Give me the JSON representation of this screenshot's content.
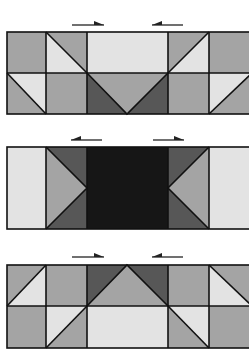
{
  "colors": {
    "medium": "#a4a4a4",
    "light": "#e3e3e3",
    "dark": "#575757",
    "black": "#161616",
    "stroke": "#111111",
    "background": "#ffffff"
  },
  "columns": [
    7,
    46,
    87,
    168,
    209,
    252
  ],
  "panels": [
    {
      "name": "top-panel",
      "top": 32,
      "mid": 73,
      "bottom": 114,
      "arrows": [
        {
          "x1": 72,
          "x2": 104,
          "y": 25,
          "direction": "right"
        },
        {
          "x1": 152,
          "x2": 183,
          "y": 25,
          "direction": "left"
        }
      ],
      "shapes": [
        {
          "type": "rect",
          "x": 7,
          "y": 32,
          "w": 39,
          "h": 41,
          "fill": "medium"
        },
        {
          "type": "poly",
          "points": "46,32 87,32 87,73",
          "fill": "medium"
        },
        {
          "type": "poly",
          "points": "46,32 87,73 46,73",
          "fill": "light"
        },
        {
          "type": "rect",
          "x": 87,
          "y": 32,
          "w": 81,
          "h": 41,
          "fill": "light"
        },
        {
          "type": "poly",
          "points": "168,32 209,32 168,73",
          "fill": "medium"
        },
        {
          "type": "poly",
          "points": "209,32 209,73 168,73",
          "fill": "light"
        },
        {
          "type": "rect",
          "x": 209,
          "y": 32,
          "w": 43,
          "h": 41,
          "fill": "medium"
        },
        {
          "type": "poly",
          "points": "7,73 46,73 46,114",
          "fill": "light"
        },
        {
          "type": "poly",
          "points": "7,73 46,114 7,114",
          "fill": "medium"
        },
        {
          "type": "rect",
          "x": 46,
          "y": 73,
          "w": 41,
          "h": 41,
          "fill": "medium"
        },
        {
          "type": "poly",
          "points": "87,73 87,114 127,114",
          "fill": "dark"
        },
        {
          "type": "poly",
          "points": "168,73 168,114 127,114",
          "fill": "dark"
        },
        {
          "type": "poly",
          "points": "87,73 168,73 127,114",
          "fill": "medium"
        },
        {
          "type": "rect",
          "x": 168,
          "y": 73,
          "w": 41,
          "h": 41,
          "fill": "medium"
        },
        {
          "type": "poly",
          "points": "209,73 252,73 209,114",
          "fill": "light"
        },
        {
          "type": "poly",
          "points": "252,73 252,114 209,114",
          "fill": "medium"
        }
      ]
    },
    {
      "name": "middle-panel",
      "top": 147,
      "mid": null,
      "bottom": 229,
      "arrows": [
        {
          "x1": 71,
          "x2": 102,
          "y": 140,
          "direction": "left"
        },
        {
          "x1": 153,
          "x2": 184,
          "y": 140,
          "direction": "right"
        }
      ],
      "shapes": [
        {
          "type": "rect",
          "x": 7,
          "y": 147,
          "w": 39,
          "h": 82,
          "fill": "light"
        },
        {
          "type": "poly",
          "points": "46,147 87,147 87,188",
          "fill": "dark"
        },
        {
          "type": "poly",
          "points": "46,229 87,229 87,188",
          "fill": "dark"
        },
        {
          "type": "poly",
          "points": "46,147 87,188 46,229",
          "fill": "medium"
        },
        {
          "type": "rect",
          "x": 87,
          "y": 147,
          "w": 81,
          "h": 82,
          "fill": "black"
        },
        {
          "type": "poly",
          "points": "168,147 209,147 168,188",
          "fill": "dark"
        },
        {
          "type": "poly",
          "points": "168,229 209,229 168,188",
          "fill": "dark"
        },
        {
          "type": "poly",
          "points": "209,147 209,229 168,188",
          "fill": "medium"
        },
        {
          "type": "rect",
          "x": 209,
          "y": 147,
          "w": 43,
          "h": 82,
          "fill": "light"
        }
      ]
    },
    {
      "name": "bottom-panel",
      "top": 265,
      "mid": 306,
      "bottom": 348,
      "arrows": [
        {
          "x1": 72,
          "x2": 104,
          "y": 257,
          "direction": "right"
        },
        {
          "x1": 152,
          "x2": 183,
          "y": 257,
          "direction": "left"
        }
      ],
      "shapes": [
        {
          "type": "poly",
          "points": "7,265 46,265 7,306",
          "fill": "medium"
        },
        {
          "type": "poly",
          "points": "46,265 46,306 7,306",
          "fill": "light"
        },
        {
          "type": "rect",
          "x": 46,
          "y": 265,
          "w": 41,
          "h": 41,
          "fill": "medium"
        },
        {
          "type": "poly",
          "points": "87,265 127,265 87,306",
          "fill": "dark"
        },
        {
          "type": "poly",
          "points": "127,265 168,265 168,306",
          "fill": "dark"
        },
        {
          "type": "poly",
          "points": "127,265 168,306 87,306",
          "fill": "medium"
        },
        {
          "type": "rect",
          "x": 168,
          "y": 265,
          "w": 41,
          "h": 41,
          "fill": "medium"
        },
        {
          "type": "poly",
          "points": "209,265 252,265 252,306",
          "fill": "medium"
        },
        {
          "type": "poly",
          "points": "209,265 252,306 209,306",
          "fill": "light"
        },
        {
          "type": "rect",
          "x": 7,
          "y": 306,
          "w": 39,
          "h": 42,
          "fill": "medium"
        },
        {
          "type": "poly",
          "points": "46,306 87,306 46,348",
          "fill": "light"
        },
        {
          "type": "poly",
          "points": "87,306 87,348 46,348",
          "fill": "medium"
        },
        {
          "type": "rect",
          "x": 87,
          "y": 306,
          "w": 81,
          "h": 42,
          "fill": "light"
        },
        {
          "type": "poly",
          "points": "168,306 209,306 209,348",
          "fill": "light"
        },
        {
          "type": "poly",
          "points": "168,306 209,348 168,348",
          "fill": "medium"
        },
        {
          "type": "rect",
          "x": 209,
          "y": 306,
          "w": 43,
          "h": 42,
          "fill": "medium"
        }
      ]
    }
  ],
  "lines": [
    {
      "panel": 0,
      "d": "M46,32 L87,73"
    },
    {
      "panel": 0,
      "d": "M209,32 L168,73"
    },
    {
      "panel": 0,
      "d": "M7,73 L46,114"
    },
    {
      "panel": 0,
      "d": "M87,73 L127,114 L168,73"
    },
    {
      "panel": 0,
      "d": "M252,73 L209,114"
    },
    {
      "panel": 1,
      "d": "M46,147 L87,188 L46,229"
    },
    {
      "panel": 1,
      "d": "M209,147 L168,188 L209,229"
    },
    {
      "panel": 2,
      "d": "M46,265 L7,306"
    },
    {
      "panel": 2,
      "d": "M87,306 L127,265 L168,306"
    },
    {
      "panel": 2,
      "d": "M209,265 L252,306"
    },
    {
      "panel": 2,
      "d": "M87,306 L46,348"
    },
    {
      "panel": 2,
      "d": "M168,306 L209,348"
    }
  ]
}
